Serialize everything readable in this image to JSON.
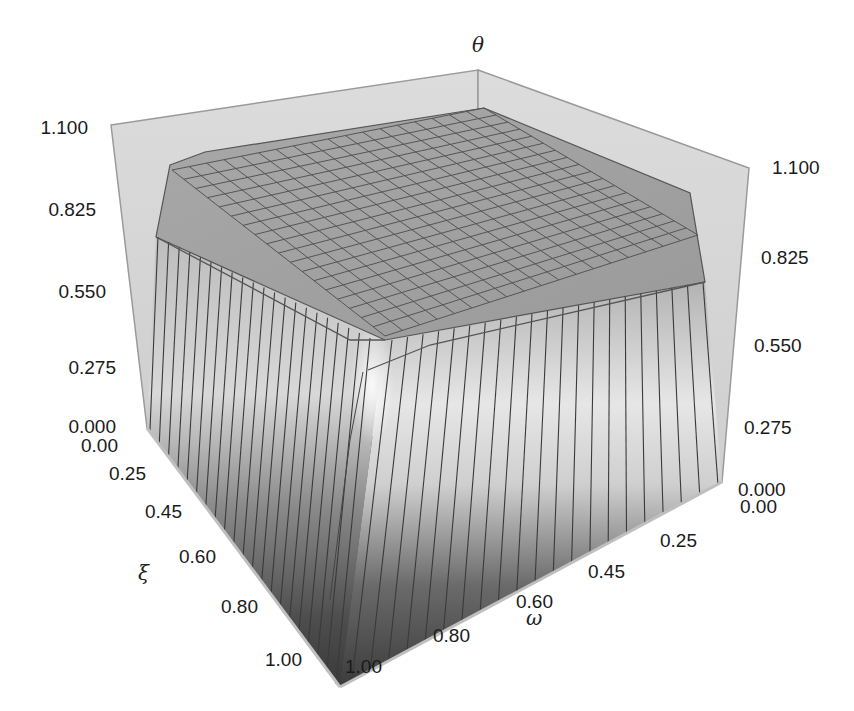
{
  "chart_data": {
    "type": "surface3d",
    "title": "",
    "axes": {
      "z": {
        "label": "θ",
        "range": [
          0.0,
          1.1
        ],
        "ticks": [
          "0.000",
          "0.275",
          "0.550",
          "0.825",
          "1.100"
        ]
      },
      "xi": {
        "label": "ξ",
        "range": [
          0.0,
          1.0
        ],
        "ticks": [
          "0.00",
          "0.25",
          "0.45",
          "0.60",
          "0.80",
          "1.00"
        ]
      },
      "omega": {
        "label": "ω",
        "range": [
          0.0,
          1.0
        ],
        "ticks": [
          "0.00",
          "0.25",
          "0.45",
          "0.60",
          "0.80",
          "1.00"
        ]
      }
    },
    "grid": true,
    "legend": null,
    "surface_description": "Plateau surface: θ ≈ 1.0 across the interior of the (ξ, ω) domain, dropping steeply to θ ≈ 0 near ξ = 1 and ω = 1 edges; rounded corner near (ξ=1, ω=1). Mesh approx. 20×20 grid.",
    "plateau_value": 1.0,
    "floor_value": 0.0,
    "colormap": "grayscale"
  },
  "labels": {
    "z_axis_title": "θ",
    "xi_axis_title": "ξ",
    "omega_axis_title": "ω",
    "z_left_ticks": [
      "1.100",
      "0.825",
      "0.550",
      "0.275",
      "0.000"
    ],
    "z_right_ticks": [
      "1.100",
      "0.825",
      "0.550",
      "0.275",
      "0.000"
    ],
    "xi_ticks": [
      "0.00",
      "0.25",
      "0.45",
      "0.60",
      "0.80",
      "1.00"
    ],
    "omega_ticks": [
      "0.00",
      "0.25",
      "0.45",
      "0.60",
      "0.80",
      "1.00"
    ]
  }
}
